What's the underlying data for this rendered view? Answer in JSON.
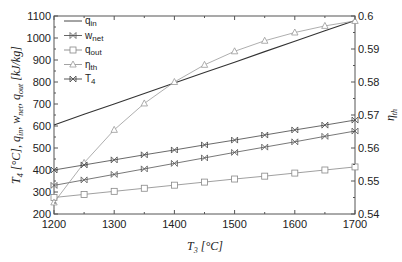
{
  "chart_data": {
    "type": "line",
    "title": "",
    "xlabel": "T3 [°C]",
    "ylabel": "T4 [°C], q_in, w_net, q_out [kJ/kg]",
    "y2label": "η_th",
    "xlim": [
      1200,
      1700
    ],
    "ylim": [
      200,
      1100
    ],
    "y2lim": [
      0.54,
      0.6
    ],
    "x_ticks": [
      1200,
      1300,
      1400,
      1500,
      1600,
      1700
    ],
    "y_ticks": [
      200,
      300,
      400,
      500,
      600,
      700,
      800,
      900,
      1000,
      1100
    ],
    "y2_ticks": [
      0.54,
      0.55,
      0.56,
      0.57,
      0.58,
      0.59,
      0.6
    ],
    "y2_tick_labels": [
      "0.54",
      "0.55",
      "0.56",
      "0.57",
      "0.58",
      "0.59",
      "0.6"
    ],
    "grid": false,
    "legend_position": "upper left",
    "x": [
      1200,
      1250,
      1300,
      1350,
      1400,
      1450,
      1500,
      1550,
      1600,
      1650,
      1700
    ],
    "series": [
      {
        "name": "q_in",
        "label": "q",
        "sub": "in",
        "axis": "left",
        "marker": "none",
        "color": "#333333",
        "values": [
          605,
          653,
          700,
          748,
          795,
          843,
          890,
          938,
          985,
          1033,
          1080
        ]
      },
      {
        "name": "w_net",
        "label": "w",
        "sub": "net",
        "axis": "left",
        "marker": "x-box",
        "color": "#555555",
        "values": [
          330,
          355,
          380,
          405,
          430,
          455,
          480,
          504,
          528,
          553,
          577
        ]
      },
      {
        "name": "q_out",
        "label": "q",
        "sub": "out",
        "axis": "left",
        "marker": "square",
        "color": "#888888",
        "values": [
          275,
          289,
          303,
          317,
          331,
          345,
          359,
          372,
          386,
          400,
          414
        ]
      },
      {
        "name": "η_th",
        "label": "η",
        "sub": "th",
        "axis": "right",
        "marker": "triangle",
        "color": "#999999",
        "values": [
          0.5435,
          0.5555,
          0.5655,
          0.5735,
          0.58,
          0.5852,
          0.5893,
          0.5925,
          0.595,
          0.597,
          0.5985
        ]
      },
      {
        "name": "T4",
        "label": "T",
        "sub": "4",
        "axis": "left",
        "marker": "x-box",
        "color": "#444444",
        "values": [
          400,
          423,
          446,
          469,
          491,
          514,
          536,
          559,
          582,
          604,
          627
        ]
      }
    ]
  }
}
